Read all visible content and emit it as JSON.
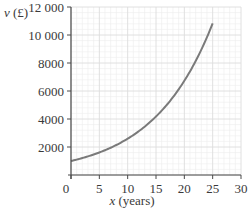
{
  "chart_data": {
    "type": "line",
    "title": "",
    "xlabel": "x (years)",
    "ylabel": "v (£)",
    "xlim": [
      0,
      30
    ],
    "ylim": [
      0,
      12000
    ],
    "x_ticks": [
      0,
      5,
      10,
      15,
      20,
      25,
      30
    ],
    "x_tick_labels": [
      "0",
      "5",
      "10",
      "15",
      "20",
      "25",
      "30"
    ],
    "y_ticks": [
      2000,
      4000,
      6000,
      8000,
      10000,
      12000
    ],
    "y_tick_labels": [
      "2000",
      "4000",
      "6000",
      "8000",
      "10 000",
      "12 000"
    ],
    "grid": true,
    "minor_grid": {
      "x_step": 1,
      "y_step": 400
    },
    "major_grid": {
      "x_step": 5,
      "y_step": 2000
    },
    "legend": null,
    "series": [
      {
        "name": "v",
        "formula_estimate": "v = 1000 × 1.1^x",
        "x": [
          0,
          1,
          2,
          3,
          4,
          5,
          6,
          7,
          8,
          9,
          10,
          11,
          12,
          13,
          14,
          15,
          16,
          17,
          18,
          19,
          20,
          21,
          22,
          23,
          24,
          25
        ],
        "y": [
          1000,
          1100,
          1210,
          1331,
          1464,
          1611,
          1772,
          1949,
          2144,
          2358,
          2594,
          2853,
          3138,
          3452,
          3797,
          4177,
          4595,
          5054,
          5560,
          6116,
          6727,
          7400,
          8140,
          8954,
          9850,
          10835
        ],
        "color": "#7a7a7a"
      }
    ]
  },
  "colors": {
    "axis": "#4a4a4a",
    "grid_minor": "#ececec",
    "grid_major": "#dcdcdc",
    "curve": "#7a7a7a",
    "text": "#3a3a3a"
  }
}
